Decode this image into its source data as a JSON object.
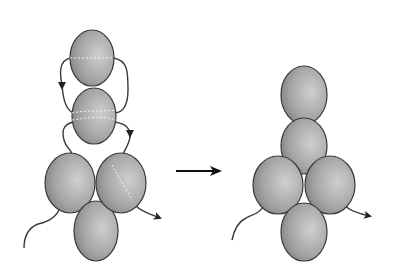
{
  "diagram": {
    "type": "beadwork-step",
    "colors": {
      "bead_light": "#c8c8c8",
      "bead_dark": "#7a7a7a",
      "outline": "#3a3a3a",
      "thread": "#3a3a3a",
      "arrow": "#111111",
      "background": "#ffffff"
    },
    "left_figure": {
      "label": "before",
      "beads": [
        {
          "name": "top-bead",
          "cx": 92,
          "cy": 58,
          "rx": 22,
          "ry": 28
        },
        {
          "name": "second-bead",
          "cx": 94,
          "cy": 116,
          "rx": 22,
          "ry": 28
        },
        {
          "name": "left-bead",
          "cx": 70,
          "cy": 183,
          "rx": 25,
          "ry": 30
        },
        {
          "name": "right-bead",
          "cx": 121,
          "cy": 183,
          "rx": 25,
          "ry": 30
        },
        {
          "name": "bottom-bead",
          "cx": 96,
          "cy": 231,
          "rx": 22,
          "ry": 30
        }
      ]
    },
    "transition_arrow": {
      "from_x": 176,
      "to_x": 222,
      "y": 171
    },
    "right_figure": {
      "label": "after",
      "beads": [
        {
          "name": "top-bead",
          "cx": 304,
          "cy": 95,
          "rx": 23,
          "ry": 29
        },
        {
          "name": "second-bead",
          "cx": 304,
          "cy": 146,
          "rx": 23,
          "ry": 28
        },
        {
          "name": "left-bead",
          "cx": 278,
          "cy": 185,
          "rx": 25,
          "ry": 29
        },
        {
          "name": "right-bead",
          "cx": 330,
          "cy": 185,
          "rx": 25,
          "ry": 29
        },
        {
          "name": "bottom-bead",
          "cx": 304,
          "cy": 232,
          "rx": 23,
          "ry": 29
        }
      ]
    }
  }
}
